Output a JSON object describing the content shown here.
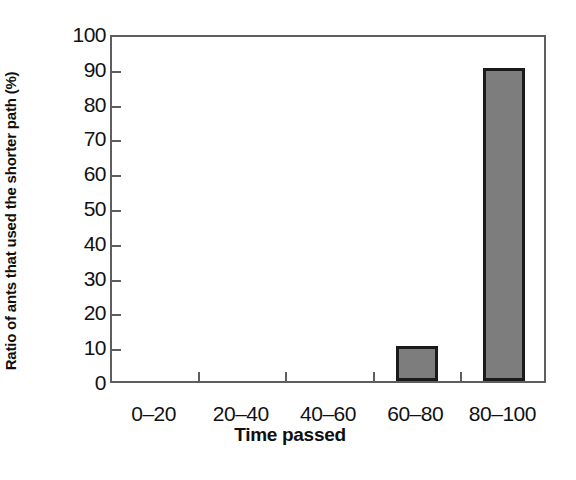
{
  "chart_data": {
    "type": "bar",
    "title": "",
    "xlabel": "Time passed",
    "ylabel": "Ratio of ants that used the shorter path (%)",
    "categories": [
      "0–20",
      "20–40",
      "40–60",
      "60–80",
      "80–100"
    ],
    "values": [
      0,
      0,
      0,
      10,
      90
    ],
    "ylim": [
      0,
      100
    ],
    "ytick_labels": [
      "0",
      "10",
      "20",
      "30",
      "40",
      "50",
      "60",
      "70",
      "80",
      "90",
      "100"
    ],
    "ytick_values": [
      0,
      10,
      20,
      30,
      40,
      50,
      60,
      70,
      80,
      90,
      100
    ],
    "grid": false,
    "legend": false,
    "series": [
      {
        "name": "Ratio of ants that used the shorter path (%)",
        "values": [
          0,
          0,
          0,
          10,
          90
        ],
        "fill_color": "#7d7d7d",
        "edge_color": "#1a1a1a"
      }
    ],
    "frame_color": "#5e5e5e",
    "background_color": "#ffffff"
  }
}
